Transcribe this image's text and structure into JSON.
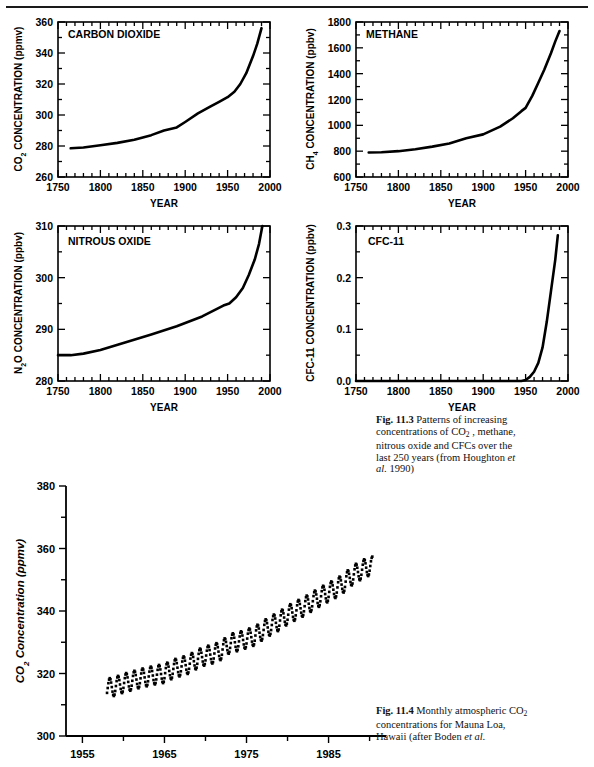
{
  "figure": {
    "top_rule": true,
    "caption_113": {
      "label": "Fig. 11.3",
      "lines": [
        "Patterns of",
        "increasing concentrations of",
        "CO2 , methane, nitrous oxide",
        "and CFCs over the last 250",
        "years (from Houghton et al.",
        "1990)"
      ],
      "source": "Houghton et al. 1990"
    },
    "caption_114": {
      "label": "Fig. 11.4",
      "lines": [
        "Monthly",
        "atmospheric CO2",
        "concentrations for Mauna Loa,",
        "Hawaii (after Boden et al."
      ],
      "source": "Boden et al."
    }
  },
  "chart_data": [
    {
      "type": "line",
      "id": "carbon-dioxide",
      "title": "CARBON DIOXIDE",
      "xlabel": "YEAR",
      "ylabel": "CO2 CONCENTRATION (ppmv)",
      "xlim": [
        1750,
        2000
      ],
      "ylim": [
        260,
        360
      ],
      "xticks": [
        1750,
        1800,
        1850,
        1900,
        1950,
        2000
      ],
      "yticks": [
        260,
        280,
        300,
        320,
        340,
        360
      ],
      "xminor_step": 10,
      "yminor_step": 10,
      "grid": false,
      "legend": "none",
      "x": [
        1765,
        1780,
        1800,
        1820,
        1840,
        1860,
        1875,
        1890,
        1900,
        1915,
        1930,
        1940,
        1950,
        1958,
        1965,
        1972,
        1980,
        1985,
        1990
      ],
      "values": [
        278.5,
        279,
        280.5,
        282,
        284,
        287,
        290,
        292,
        295.5,
        301,
        305.5,
        308.5,
        311.5,
        315,
        320,
        327,
        338,
        346,
        356
      ]
    },
    {
      "type": "line",
      "id": "methane",
      "title": "METHANE",
      "xlabel": "YEAR",
      "ylabel": "CH4 CONCENTRATION (ppbv)",
      "xlim": [
        1750,
        2000
      ],
      "ylim": [
        600,
        1800
      ],
      "xticks": [
        1750,
        1800,
        1850,
        1900,
        1950,
        2000
      ],
      "yticks": [
        600,
        800,
        1000,
        1200,
        1400,
        1600,
        1800
      ],
      "xminor_step": 10,
      "yminor_step": 100,
      "grid": false,
      "legend": "none",
      "x": [
        1765,
        1780,
        1800,
        1820,
        1840,
        1860,
        1880,
        1900,
        1920,
        1935,
        1945,
        1950,
        1958,
        1965,
        1972,
        1980,
        1985,
        1990
      ],
      "values": [
        790,
        792,
        800,
        815,
        835,
        860,
        900,
        930,
        990,
        1055,
        1110,
        1135,
        1230,
        1330,
        1430,
        1560,
        1650,
        1730
      ]
    },
    {
      "type": "line",
      "id": "nitrous-oxide",
      "title": "NITROUS OXIDE",
      "xlabel": "YEAR",
      "ylabel": "N2O CONCENTRATION (ppbv)",
      "xlim": [
        1750,
        2000
      ],
      "ylim": [
        280,
        310
      ],
      "xticks": [
        1750,
        1800,
        1850,
        1900,
        1950,
        2000
      ],
      "yticks": [
        280,
        290,
        300,
        310
      ],
      "xminor_step": 10,
      "yminor_step": 5,
      "grid": false,
      "legend": "none",
      "x": [
        1750,
        1765,
        1780,
        1800,
        1830,
        1860,
        1890,
        1920,
        1945,
        1952,
        1960,
        1968,
        1975,
        1982,
        1987,
        1991
      ],
      "values": [
        285,
        285,
        285.3,
        286,
        287.5,
        289,
        290.6,
        292.5,
        294.6,
        295,
        296.2,
        298,
        300.5,
        303.5,
        306.5,
        310
      ]
    },
    {
      "type": "line",
      "id": "cfc-11",
      "title": "CFC-11",
      "xlabel": "YEAR",
      "ylabel": "CFC-11 CONCENTRATION (ppbv)",
      "xlim": [
        1750,
        2000
      ],
      "ylim": [
        0.0,
        0.3
      ],
      "xticks": [
        1750,
        1800,
        1850,
        1900,
        1950,
        2000
      ],
      "yticks": [
        "0.0",
        "0.1",
        "0.2",
        "0.3"
      ],
      "xminor_step": 10,
      "yminor_step": 0.05,
      "grid": false,
      "legend": "none",
      "x": [
        1750,
        1900,
        1945,
        1950,
        1955,
        1960,
        1965,
        1970,
        1975,
        1980,
        1985,
        1988
      ],
      "values": [
        0.0,
        0.0,
        0.0,
        0.002,
        0.008,
        0.018,
        0.035,
        0.065,
        0.115,
        0.175,
        0.235,
        0.282
      ]
    },
    {
      "type": "scatter",
      "id": "mauna-loa",
      "title": "",
      "xlabel": "",
      "ylabel": "CO2 Concentration (ppmv)",
      "xlim": [
        1953,
        1992
      ],
      "ylim": [
        300,
        380
      ],
      "xticks": [
        1955,
        1965,
        1975,
        1985
      ],
      "yticks": [
        300,
        320,
        340,
        360,
        380
      ],
      "xminor_step": 5,
      "yminor_step": 10,
      "grid": false,
      "legend": "none",
      "series_note": "monthly values, seasonal sawtooth",
      "annual_mean": {
        "years": [
          1958,
          1959,
          1960,
          1961,
          1962,
          1963,
          1964,
          1965,
          1966,
          1967,
          1968,
          1969,
          1970,
          1971,
          1972,
          1973,
          1974,
          1975,
          1976,
          1977,
          1978,
          1979,
          1980,
          1981,
          1982,
          1983,
          1984,
          1985,
          1986,
          1987,
          1988,
          1989,
          1990
        ],
        "values": [
          315.3,
          315.9,
          316.9,
          317.6,
          318.4,
          319.0,
          319.6,
          320.0,
          321.4,
          322.2,
          323.0,
          324.6,
          325.7,
          326.3,
          327.5,
          329.7,
          330.2,
          331.1,
          332.0,
          333.8,
          335.4,
          336.8,
          338.7,
          340.1,
          341.4,
          343.0,
          344.6,
          346.0,
          347.4,
          349.2,
          351.6,
          353.1,
          354.4
        ]
      },
      "seasonal_amplitude_ppmv": 6.0
    }
  ]
}
